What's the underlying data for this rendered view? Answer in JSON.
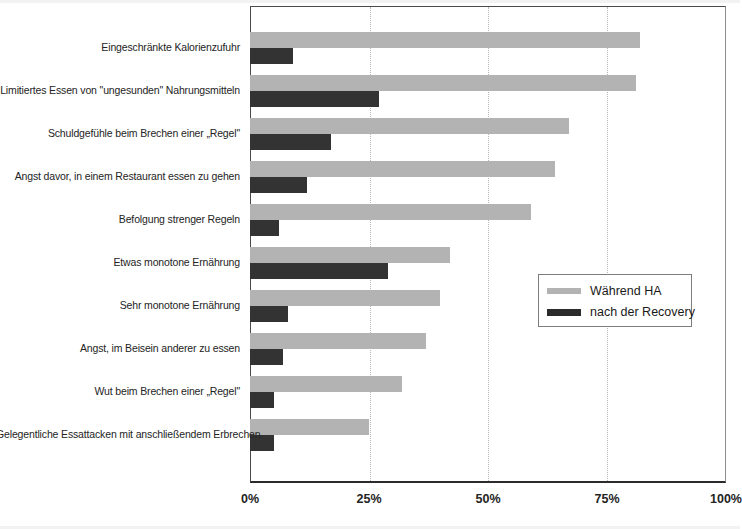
{
  "chart_data": {
    "type": "bar",
    "orientation": "horizontal",
    "title": "",
    "subtitle": "",
    "xlabel": "",
    "ylabel": "",
    "xlim": [
      0,
      100
    ],
    "xticks": [
      0,
      25,
      50,
      75,
      100
    ],
    "xticklabels": [
      "0%",
      "25%",
      "50%",
      "75%",
      "100%"
    ],
    "grid": "vertical-dotted",
    "legend_position": "center-right",
    "categories": [
      "Eingeschränkte Kalorienzufuhr",
      "Limitiertes Essen von \"ungesunden\" Nahrungsmitteln",
      "Schuldgefühle beim Brechen einer „Regel\"",
      "Angst davor, in einem Restaurant essen zu gehen",
      "Befolgung strenger Regeln",
      "Etwas monotone Ernährung",
      "Sehr monotone Ernährung",
      "Angst, im Beisein anderer zu essen",
      "Wut beim Brechen einer „Regel\"",
      "Gelegentliche Essattacken mit anschließendem Erbrechen"
    ],
    "series": [
      {
        "name": "Während HA",
        "color": "#b3b3b3",
        "values": [
          82,
          81,
          67,
          64,
          59,
          42,
          40,
          37,
          32,
          25
        ]
      },
      {
        "name": "nach der Recovery",
        "color": "#333333",
        "values": [
          9,
          27,
          17,
          12,
          6,
          29,
          8,
          7,
          5,
          5
        ]
      }
    ]
  },
  "legend": {
    "items": [
      {
        "label": "Während HA",
        "swatch": "light"
      },
      {
        "label": "nach der Recovery",
        "swatch": "dark"
      }
    ]
  }
}
